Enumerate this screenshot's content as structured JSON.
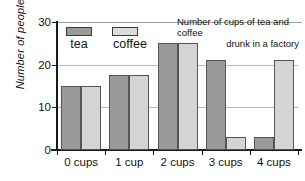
{
  "chart_data": {
    "type": "bar",
    "title": "Number of cups of tea and coffee drunk in a factory",
    "title_line_1": "Number of cups of tea and coffee",
    "title_line_2": "drunk in a factory",
    "xlabel": "",
    "ylabel": "Number of people",
    "categories": [
      "0 cups",
      "1 cup",
      "2 cups",
      "3 cups",
      "4 cups"
    ],
    "series": [
      {
        "name": "tea",
        "color": "#9a9a9a",
        "values": [
          15,
          17.5,
          25,
          21,
          3
        ]
      },
      {
        "name": "coffee",
        "color": "#d4d4d4",
        "values": [
          15,
          17.5,
          25,
          3,
          21
        ]
      }
    ],
    "ylim": [
      0,
      30
    ],
    "yticks": [
      0,
      10,
      20,
      30
    ],
    "ytick_labels": [
      "0",
      "10",
      "20",
      "30"
    ],
    "grid": true,
    "legend_position": "inside-top-left"
  },
  "legend": {
    "tea_label": "tea",
    "coffee_label": "coffee"
  }
}
